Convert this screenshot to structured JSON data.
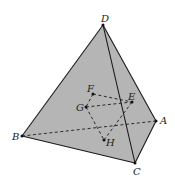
{
  "diagram": {
    "type": "tetrahedron",
    "colors": {
      "face_fill": "#b5b5b5",
      "edge": "#1a1a1a",
      "background": "#ffffff"
    },
    "vertices": {
      "A": {
        "label": "A",
        "x": 156,
        "y": 121
      },
      "B": {
        "label": "B",
        "x": 22,
        "y": 136
      },
      "C": {
        "label": "C",
        "x": 135,
        "y": 163
      },
      "D": {
        "label": "D",
        "x": 103,
        "y": 25
      }
    },
    "inner_points": {
      "E": {
        "label": "E",
        "x": 132,
        "y": 102
      },
      "F": {
        "label": "F",
        "x": 93,
        "y": 94
      },
      "G": {
        "label": "G",
        "x": 86,
        "y": 107
      },
      "H": {
        "label": "H",
        "x": 104,
        "y": 140
      }
    },
    "solid_edges": [
      "DB",
      "DC",
      "DA",
      "BC",
      "CA"
    ],
    "dashed_edges": [
      "BA",
      "FE",
      "GE",
      "FG",
      "GH",
      "HE"
    ]
  }
}
